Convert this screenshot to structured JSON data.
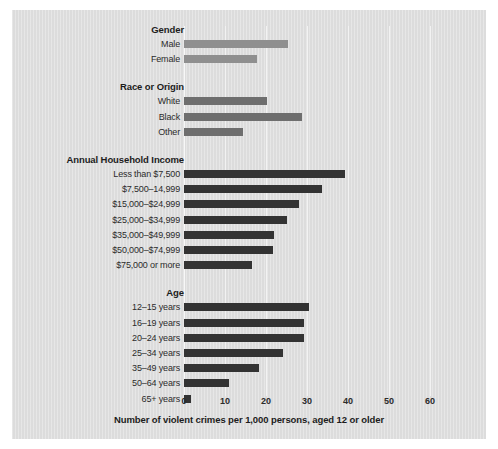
{
  "chart_data": {
    "type": "bar",
    "orientation": "horizontal",
    "title": "",
    "xlabel": "Number of violent crimes per 1,000 persons, aged 12 or older",
    "ylabel": "",
    "xlim": [
      0,
      65
    ],
    "xticks": [
      0,
      10,
      20,
      30,
      40,
      50,
      60
    ],
    "xtick_labels": [
      "0",
      "10",
      "20",
      "30",
      "40",
      "50",
      "60"
    ],
    "grid": true,
    "legend": "none",
    "groups": [
      {
        "name": "Gender",
        "color": "#8f8f8f",
        "categories": [
          "Male",
          "Female"
        ],
        "values": [
          25.4,
          17.8
        ]
      },
      {
        "name": "Race or Origin",
        "color": "#6e6e6e",
        "categories": [
          "White",
          "Black",
          "Other"
        ],
        "values": [
          20.2,
          28.9,
          14.5
        ]
      },
      {
        "name": "Annual Household Income",
        "color": "#333333",
        "categories": [
          "Less than $7,500",
          "$7,500–14,999",
          "$15,000–$24,999",
          "$25,000–$34,999",
          "$35,000–$49,999",
          "$50,000–$74,999",
          "$75,000 or more"
        ],
        "values": [
          39.3,
          33.7,
          28.0,
          25.1,
          22.0,
          21.7,
          16.6
        ]
      },
      {
        "name": "Age",
        "color": "#333333",
        "categories": [
          "12–15 years",
          "16–19 years",
          "20–24 years",
          "25–34 years",
          "35–49 years",
          "50–64 years",
          "65+ years"
        ],
        "values": [
          30.5,
          29.3,
          29.2,
          24.2,
          18.4,
          11.0,
          1.8
        ]
      }
    ]
  },
  "colors": {
    "background": "#dcdcdc",
    "gridline": "#f2f2f2",
    "text": "#1c1c1c",
    "gender_bar": "#8f8f8f",
    "race_bar": "#6e6e6e",
    "income_bar": "#333333",
    "age_bar": "#333333"
  }
}
